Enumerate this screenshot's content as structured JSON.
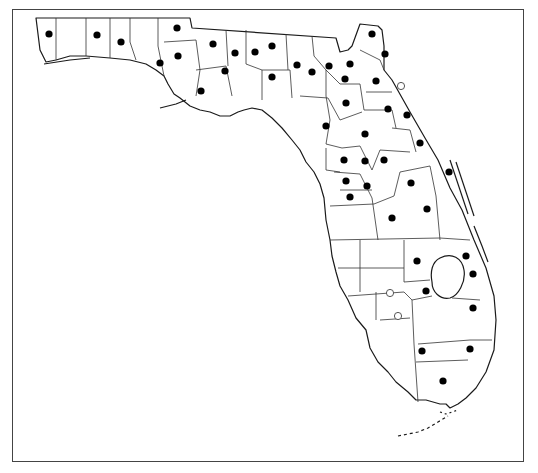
{
  "map": {
    "subject": "Florida county distribution map",
    "legend_symbols": {
      "filled": "record present (filled circle)",
      "open": "record present (open circle)"
    },
    "colors": {
      "outline": "#1a1a1a",
      "dot": "#000000",
      "background": "#ffffff"
    },
    "filled_dots": [
      [
        49,
        34
      ],
      [
        97,
        35
      ],
      [
        121,
        42
      ],
      [
        177,
        28
      ],
      [
        178,
        56
      ],
      [
        160,
        63
      ],
      [
        201,
        91
      ],
      [
        213,
        44
      ],
      [
        235,
        53
      ],
      [
        255,
        52
      ],
      [
        225,
        71
      ],
      [
        272,
        77
      ],
      [
        272,
        46
      ],
      [
        312,
        72
      ],
      [
        297,
        65
      ],
      [
        372,
        34
      ],
      [
        385,
        54
      ],
      [
        329,
        66
      ],
      [
        350,
        64
      ],
      [
        376,
        81
      ],
      [
        345,
        79
      ],
      [
        388,
        109
      ],
      [
        346,
        103
      ],
      [
        407,
        115
      ],
      [
        326,
        126
      ],
      [
        365,
        134
      ],
      [
        420,
        143
      ],
      [
        344,
        160
      ],
      [
        365,
        161
      ],
      [
        384,
        160
      ],
      [
        346,
        181
      ],
      [
        367,
        186
      ],
      [
        411,
        183
      ],
      [
        350,
        197
      ],
      [
        449,
        172
      ],
      [
        392,
        218
      ],
      [
        427,
        209
      ],
      [
        466,
        256
      ],
      [
        473,
        274
      ],
      [
        417,
        261
      ],
      [
        426,
        291
      ],
      [
        473,
        308
      ],
      [
        422,
        351
      ],
      [
        470,
        349
      ],
      [
        443,
        381
      ]
    ],
    "open_dots": [
      [
        401,
        86
      ],
      [
        390,
        293
      ],
      [
        398,
        316
      ]
    ]
  }
}
